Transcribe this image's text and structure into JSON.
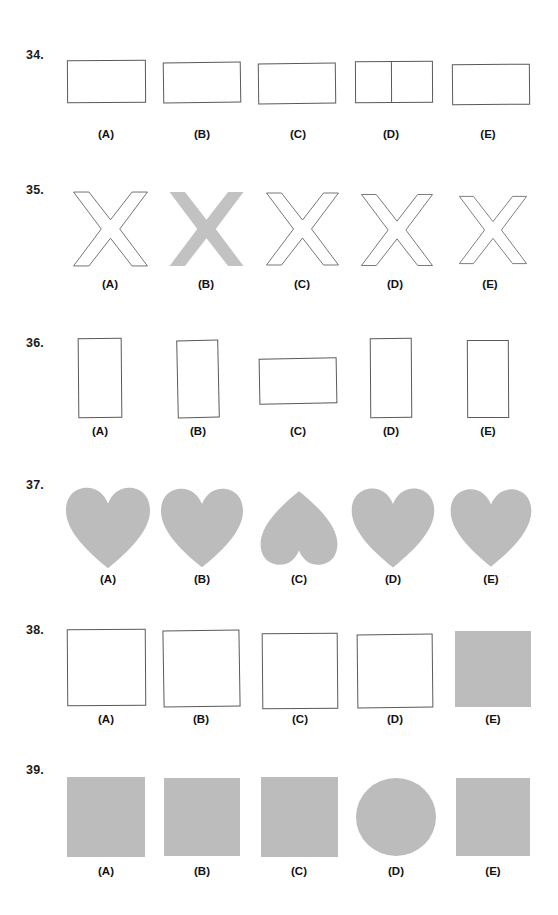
{
  "document": {
    "type": "visual-discrimination-worksheet",
    "background_color": "#ffffff",
    "outline_color": "#5a5a5a",
    "fill_gray": "#bcbcbc",
    "option_letters": [
      "(A)",
      "(B)",
      "(C)",
      "(D)",
      "(E)"
    ]
  },
  "questions": [
    {
      "number": "34.",
      "shape_kind": "horizontal-rectangle",
      "options": [
        {
          "letter": "(A)",
          "style": "outline",
          "width": 78,
          "height": 42,
          "divided": false,
          "note": "plain horizontal rectangle"
        },
        {
          "letter": "(B)",
          "style": "outline",
          "width": 78,
          "height": 41,
          "divided": false,
          "note": "plain horizontal rectangle"
        },
        {
          "letter": "(C)",
          "style": "outline",
          "width": 77,
          "height": 41,
          "divided": false,
          "note": "plain horizontal rectangle"
        },
        {
          "letter": "(D)",
          "style": "outline",
          "width": 78,
          "height": 41,
          "divided": true,
          "note": "rectangle split by vertical line"
        },
        {
          "letter": "(E)",
          "style": "outline",
          "width": 78,
          "height": 41,
          "divided": false,
          "note": "plain horizontal rectangle"
        }
      ],
      "odd_one_out": "(D)"
    },
    {
      "number": "35.",
      "shape_kind": "letter-x",
      "options": [
        {
          "letter": "(A)",
          "style": "outline",
          "width": 76,
          "height": 80,
          "note": "outlined X"
        },
        {
          "letter": "(B)",
          "style": "solid",
          "width": 76,
          "height": 80,
          "note": "solid gray filled X"
        },
        {
          "letter": "(C)",
          "style": "outline",
          "width": 74,
          "height": 80,
          "note": "outlined X"
        },
        {
          "letter": "(D)",
          "style": "outline",
          "width": 74,
          "height": 78,
          "note": "outlined X"
        },
        {
          "letter": "(E)",
          "style": "outline",
          "width": 70,
          "height": 78,
          "note": "outlined X"
        }
      ],
      "odd_one_out": "(B)"
    },
    {
      "number": "36.",
      "shape_kind": "vertical-rectangle",
      "options": [
        {
          "letter": "(A)",
          "style": "outline",
          "width": 44,
          "height": 80,
          "orientation": "vertical"
        },
        {
          "letter": "(B)",
          "style": "outline",
          "width": 42,
          "height": 78,
          "orientation": "vertical"
        },
        {
          "letter": "(C)",
          "style": "outline",
          "width": 78,
          "height": 46,
          "orientation": "horizontal"
        },
        {
          "letter": "(D)",
          "style": "outline",
          "width": 42,
          "height": 80,
          "orientation": "vertical"
        },
        {
          "letter": "(E)",
          "style": "outline",
          "width": 42,
          "height": 78,
          "orientation": "vertical"
        }
      ],
      "odd_one_out": "(C)"
    },
    {
      "number": "37.",
      "shape_kind": "heart",
      "options": [
        {
          "letter": "(A)",
          "style": "solid",
          "width": 88,
          "height": 82,
          "rotation": 0
        },
        {
          "letter": "(B)",
          "style": "solid",
          "width": 88,
          "height": 80,
          "rotation": 0
        },
        {
          "letter": "(C)",
          "style": "solid",
          "width": 80,
          "height": 80,
          "rotation": 180
        },
        {
          "letter": "(D)",
          "style": "solid",
          "width": 86,
          "height": 82,
          "rotation": 0
        },
        {
          "letter": "(E)",
          "style": "solid",
          "width": 84,
          "height": 82,
          "rotation": 0
        }
      ],
      "odd_one_out": "(C)"
    },
    {
      "number": "38.",
      "shape_kind": "square",
      "options": [
        {
          "letter": "(A)",
          "style": "outline",
          "width": 79,
          "height": 76
        },
        {
          "letter": "(B)",
          "style": "outline",
          "width": 77,
          "height": 77
        },
        {
          "letter": "(C)",
          "style": "outline",
          "width": 76,
          "height": 76
        },
        {
          "letter": "(D)",
          "style": "outline",
          "width": 76,
          "height": 74
        },
        {
          "letter": "(E)",
          "style": "solid",
          "width": 76,
          "height": 76
        }
      ],
      "odd_one_out": "(E)"
    },
    {
      "number": "39.",
      "shape_kind": "square",
      "options": [
        {
          "letter": "(A)",
          "style": "solid",
          "width": 78,
          "height": 80,
          "form": "square"
        },
        {
          "letter": "(B)",
          "style": "solid",
          "width": 76,
          "height": 78,
          "form": "square"
        },
        {
          "letter": "(C)",
          "style": "solid",
          "width": 77,
          "height": 80,
          "form": "square"
        },
        {
          "letter": "(D)",
          "style": "solid",
          "width": 80,
          "height": 78,
          "form": "circle"
        },
        {
          "letter": "(E)",
          "style": "solid",
          "width": 74,
          "height": 78,
          "form": "square"
        }
      ],
      "odd_one_out": "(D)"
    }
  ]
}
